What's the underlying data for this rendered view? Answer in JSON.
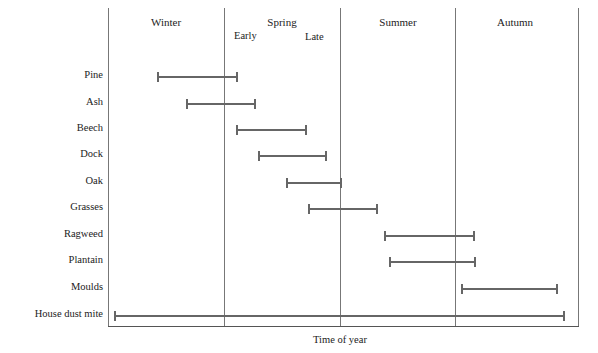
{
  "chart_data": {
    "type": "gantt",
    "title": "",
    "xlabel": "Time of year",
    "ylabel": "",
    "x_units": "season index (0 = start of Winter, 4 = end of Autumn)",
    "xlim": [
      0,
      4
    ],
    "columns": [
      "Winter",
      "Spring",
      "Summer",
      "Autumn"
    ],
    "sub_labels": [
      {
        "label": "Early",
        "season": "Spring"
      },
      {
        "label": "Late",
        "season": "Spring"
      }
    ],
    "grid": "vertical dividers between seasons",
    "categories": [
      "Pine",
      "Ash",
      "Beech",
      "Dock",
      "Oak",
      "Grasses",
      "Ragweed",
      "Plantain",
      "Moulds",
      "House dust mite"
    ],
    "series": [
      {
        "name": "Pine",
        "start": 0.42,
        "end": 1.12
      },
      {
        "name": "Ash",
        "start": 0.67,
        "end": 1.27
      },
      {
        "name": "Beech",
        "start": 1.1,
        "end": 1.71
      },
      {
        "name": "Dock",
        "start": 1.29,
        "end": 1.88
      },
      {
        "name": "Oak",
        "start": 1.53,
        "end": 2.01
      },
      {
        "name": "Grasses",
        "start": 1.72,
        "end": 2.32
      },
      {
        "name": "Ragweed",
        "start": 2.37,
        "end": 3.15
      },
      {
        "name": "Plantain",
        "start": 2.41,
        "end": 3.16
      },
      {
        "name": "Moulds",
        "start": 3.03,
        "end": 3.86
      },
      {
        "name": "House dust mite",
        "start": 0.05,
        "end": 3.92
      }
    ]
  },
  "frame": {
    "left": 108,
    "right": 578,
    "top": 8,
    "bottom": 326,
    "season_width": 116.5
  },
  "rows_y": [
    77,
    104,
    130,
    156,
    183,
    209,
    236,
    262,
    289,
    316
  ],
  "colors": {
    "bar": "#666666",
    "frame": "#555555",
    "text": "#222222"
  }
}
